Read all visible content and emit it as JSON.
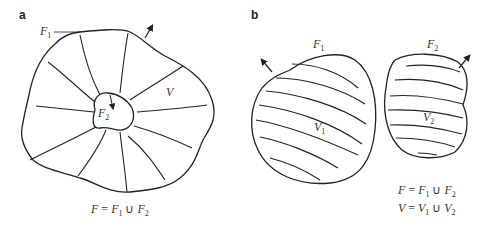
{
  "panels": {
    "a": {
      "label": "a",
      "outer_surface_label": "F",
      "outer_surface_sub": "1",
      "inner_surface_label": "F",
      "inner_surface_sub": "2",
      "volume_label": "V",
      "equation": {
        "lhs": "F",
        "eq": "=",
        "t1": "F",
        "t1_sub": "1",
        "union": "∪",
        "t2": "F",
        "t2_sub": "2"
      }
    },
    "b": {
      "label": "b",
      "body1_surface_label": "F",
      "body1_surface_sub": "1",
      "body1_volume_label": "V",
      "body1_volume_sub": "1",
      "body2_surface_label": "F",
      "body2_surface_sub": "2",
      "body2_volume_label": "V",
      "body2_volume_sub": "2",
      "equation1": {
        "lhs": "F",
        "eq": "=",
        "t1": "F",
        "t1_sub": "1",
        "union": "∪",
        "t2": "F",
        "t2_sub": "2"
      },
      "equation2": {
        "lhs": "V",
        "eq": "=",
        "t1": "V",
        "t1_sub": "1",
        "union": "∪",
        "t2": "V",
        "t2_sub": "2"
      }
    }
  },
  "colors": {
    "stroke": "#222222",
    "text": "#333333"
  }
}
